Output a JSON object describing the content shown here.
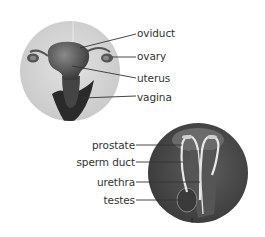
{
  "female": {
    "labels": [
      {
        "id": "oviduct",
        "text": "oviduct"
      },
      {
        "id": "ovary",
        "text": "ovary"
      },
      {
        "id": "uterus",
        "text": "uterus"
      },
      {
        "id": "vagina",
        "text": "vagina"
      }
    ]
  },
  "male": {
    "labels": [
      {
        "id": "prostate",
        "text": "prostate"
      },
      {
        "id": "sperm-duct",
        "text": "sperm duct"
      },
      {
        "id": "urethra",
        "text": "urethra"
      },
      {
        "id": "testes",
        "text": "testes"
      }
    ]
  },
  "colors": {
    "label_text": "#333333",
    "leader_line": "#333333",
    "female_bg": "#d6d6d6",
    "male_bg": "#4a4a4a"
  }
}
